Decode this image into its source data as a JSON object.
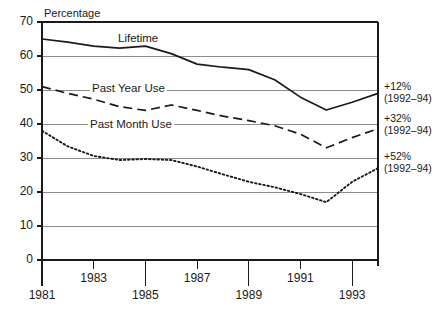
{
  "chart_data": {
    "type": "line",
    "title": "",
    "ylabel": "Percentage",
    "xlabel": "",
    "ylim": [
      0,
      70
    ],
    "ytick_labels": [
      "0",
      "10",
      "20",
      "30",
      "40",
      "50",
      "60",
      "70"
    ],
    "ytick_values": [
      0,
      10,
      20,
      30,
      40,
      50,
      60,
      70
    ],
    "grid": true,
    "legend": "inline-labels",
    "x": [
      1981,
      1982,
      1983,
      1984,
      1985,
      1986,
      1987,
      1988,
      1989,
      1990,
      1991,
      1992,
      1993,
      1994
    ],
    "xtick_labels_lower": [
      "1981",
      "1985",
      "1989",
      "1993"
    ],
    "xtick_labels_upper": [
      "1983",
      "1987",
      "1991"
    ],
    "xtick_values_lower": [
      1981,
      1985,
      1989,
      1993
    ],
    "xtick_values_upper": [
      1983,
      1987,
      1991
    ],
    "series": [
      {
        "name": "Lifetime",
        "style": "solid",
        "values": [
          65.0,
          64.1,
          62.9,
          62.3,
          62.9,
          60.7,
          57.6,
          56.7,
          56.0,
          53.0,
          47.9,
          44.1,
          46.4,
          49.0
        ]
      },
      {
        "name": "Past Year Use",
        "style": "dashed",
        "values": [
          51.0,
          49.0,
          47.3,
          45.1,
          44.0,
          45.6,
          44.0,
          42.3,
          41.0,
          39.5,
          37.0,
          33.0,
          36.0,
          38.6
        ]
      },
      {
        "name": "Past Month Use",
        "style": "dotted",
        "values": [
          38.0,
          33.4,
          30.6,
          29.4,
          29.7,
          29.4,
          27.5,
          25.2,
          23.0,
          21.4,
          19.4,
          17.0,
          23.0,
          27.0
        ]
      }
    ],
    "annotations": [
      {
        "value": "+12%",
        "period": "(1992–94)",
        "series": "Lifetime"
      },
      {
        "value": "+32%",
        "period": "(1992–94)",
        "series": "Past Year Use"
      },
      {
        "value": "+52%",
        "period": "(1992–94)",
        "series": "Past Month Use"
      }
    ],
    "colors": {
      "line": "#1a1a1a",
      "grid": "#8c8c8c",
      "axis": "#1a1a1a",
      "background": "#ffffff"
    }
  }
}
